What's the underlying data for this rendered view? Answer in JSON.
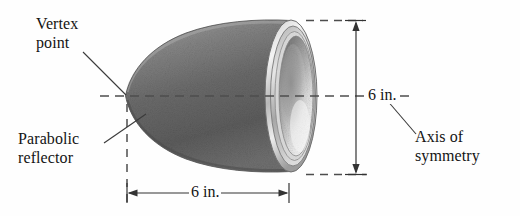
{
  "figure": {
    "background_color": "#fefefe",
    "line_color": "#333333",
    "text_color": "#141414"
  },
  "labels": {
    "vertex": "Vertex\npoint",
    "reflector": "Parabolic\nreflector",
    "axis": "Axis of\nsymmetry"
  },
  "dimensions": {
    "height_label": "6 in.",
    "depth_label": "6 in.",
    "height_value": 6,
    "depth_value": 6,
    "units": "in."
  },
  "colors": {
    "body_dark": "#5a5a5a",
    "body_mid": "#8b8b8b",
    "body_light": "#bdbdbd",
    "rim_light": "#e8e8e8",
    "rim_mid": "#a8a8a8",
    "bowl_light": "#f2f2f2",
    "bowl_mid": "#c9c9c9",
    "dash_color": "#4d4d4d",
    "leader_color": "#3a3a3a"
  }
}
